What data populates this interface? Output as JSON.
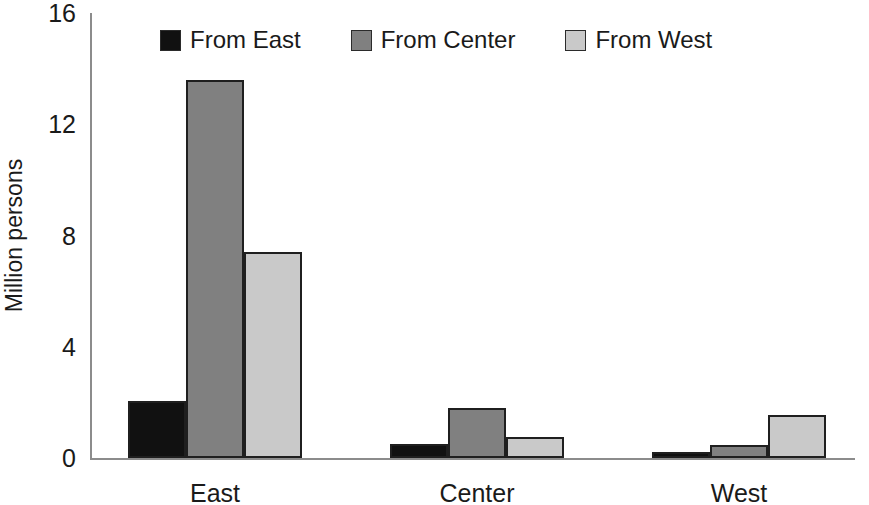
{
  "chart_data": {
    "type": "bar",
    "title": "",
    "subtitle": "",
    "xlabel": "",
    "ylabel": "Million persons",
    "categories": [
      "East",
      "Center",
      "West"
    ],
    "ylim": [
      0,
      16
    ],
    "yticks": [
      0,
      4,
      8,
      12,
      16
    ],
    "ytick_labels": [
      "0",
      "4",
      "8",
      "12",
      "16"
    ],
    "grid": false,
    "legend_position": "top-center",
    "series": [
      {
        "name": "From East",
        "color": "#111111",
        "values": [
          2.05,
          0.5,
          0.2
        ]
      },
      {
        "name": "From Center",
        "color": "#808080",
        "values": [
          13.6,
          1.8,
          0.45
        ]
      },
      {
        "name": "From West",
        "color": "#c9c9c9",
        "values": [
          7.4,
          0.75,
          1.55
        ]
      }
    ]
  },
  "colors": {
    "from_east": "#111111",
    "from_center": "#808080",
    "from_west": "#c9c9c9",
    "bar_outline": "#1f1f1f",
    "axis": "#8c8c8c",
    "text": "#1a1a1a",
    "background": "#ffffff"
  }
}
